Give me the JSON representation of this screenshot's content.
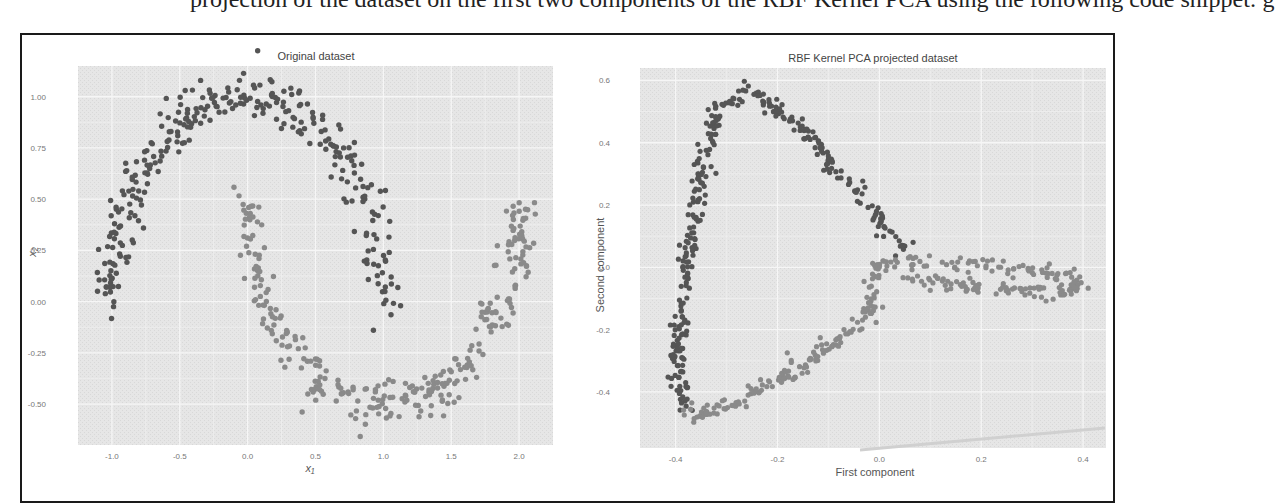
{
  "page": {
    "top_text_fragment": "   projection of the dataset on the first two components of the RBF Kernel PCA using the following code snippet:   g"
  },
  "chart_data": [
    {
      "type": "scatter",
      "title": "Original dataset",
      "xlabel": "x₁",
      "ylabel": "x₂",
      "xlim": [
        -1.25,
        2.25
      ],
      "ylim": [
        -0.7,
        1.15
      ],
      "x_ticks": [
        "-1.0",
        "-0.5",
        "0.0",
        "0.5",
        "1.0",
        "1.5",
        "2.0"
      ],
      "y_ticks": [
        "1.00",
        "0.75",
        "0.50",
        "0.25",
        "0.00",
        "-0.25",
        "-0.50"
      ],
      "grid": true,
      "background": "#e8e8e8",
      "series": [
        {
          "name": "upper moon",
          "color": "#555555",
          "description": "Arc from (-1.0, 0.0) up to (0.0, 1.0) and down to (1.0, 0.0), with noise ~0.07",
          "arc": {
            "cx": 0.0,
            "cy": 0.0,
            "r": 1.0,
            "start_deg": 0,
            "end_deg": 180
          }
        },
        {
          "name": "lower moon",
          "color": "#8a8a8a",
          "description": "Arc from (0.0, 0.5) down to (1.0, -0.5) and up to (2.0, 0.5), with noise ~0.07",
          "arc": {
            "cx": 1.0,
            "cy": 0.5,
            "r": 1.0,
            "start_deg": 180,
            "end_deg": 360
          }
        }
      ]
    },
    {
      "type": "scatter",
      "title": "RBF Kernel PCA projected dataset",
      "xlabel": "First component",
      "ylabel": "Second component",
      "xlim": [
        -0.47,
        0.445
      ],
      "ylim": [
        -0.58,
        0.64
      ],
      "x_ticks": [
        "-0.4",
        "-0.2",
        "0.0",
        "0.2",
        "0.4"
      ],
      "y_ticks": [
        "0.6",
        "0.4",
        "0.2",
        "0.0",
        "-0.2",
        "-0.4"
      ],
      "grid": true,
      "background": "#e8e8e8",
      "series": [
        {
          "name": "upper moon (projected)",
          "color": "#555555",
          "description": "Loop: from (0.05, 0.06) up-left to peak (-0.26, 0.57), down left edge to (-0.38, -0.45)",
          "key_points": [
            [
              0.05,
              0.06
            ],
            [
              -0.05,
              0.25
            ],
            [
              -0.17,
              0.47
            ],
            [
              -0.26,
              0.57
            ],
            [
              -0.32,
              0.5
            ],
            [
              -0.35,
              0.3
            ],
            [
              -0.38,
              0.0
            ],
            [
              -0.4,
              -0.3
            ],
            [
              -0.38,
              -0.45
            ]
          ]
        },
        {
          "name": "lower moon (projected)",
          "color": "#8a8a8a",
          "description": "From (-0.38,-0.47) bottom along diagonal up to (-0.02,-0.15), then horizontal loop to (0.41,-0.05)",
          "key_points": [
            [
              -0.38,
              -0.48
            ],
            [
              -0.3,
              -0.45
            ],
            [
              -0.15,
              -0.32
            ],
            [
              -0.02,
              -0.15
            ],
            [
              0.0,
              0.02
            ],
            [
              0.2,
              0.01
            ],
            [
              0.35,
              -0.02
            ],
            [
              0.41,
              -0.05
            ],
            [
              0.35,
              -0.08
            ],
            [
              0.2,
              -0.07
            ],
            [
              0.05,
              -0.03
            ]
          ]
        }
      ]
    }
  ]
}
